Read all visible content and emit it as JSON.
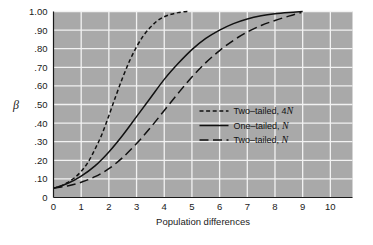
{
  "chart_data": {
    "type": "line",
    "title": "",
    "xlabel": "Population differences",
    "ylabel": "β",
    "xlim": [
      0,
      10.8
    ],
    "ylim": [
      0,
      1.0
    ],
    "grid": true,
    "legend_position": "center-right",
    "x_ticks": [
      "0",
      "1",
      "2",
      "3",
      "4",
      "5",
      "6",
      "7",
      "8",
      "9",
      "10"
    ],
    "x_tick_values": [
      0,
      1,
      2,
      3,
      4,
      5,
      6,
      7,
      8,
      9,
      10
    ],
    "y_ticks": [
      "0",
      ".10",
      ".20",
      ".30",
      ".40",
      ".50",
      ".60",
      ".70",
      ".80",
      ".90",
      "1.00"
    ],
    "y_tick_values": [
      0,
      0.1,
      0.2,
      0.3,
      0.4,
      0.5,
      0.6,
      0.7,
      0.8,
      0.9,
      1.0
    ],
    "series": [
      {
        "name": "Two-tailed, 4N",
        "legend_label_plain": "Two–tailed, 4",
        "legend_label_italic": "N",
        "style": "short-dash",
        "dasharray": "4,2.6",
        "color": "#111111",
        "x": [
          0,
          0.25,
          0.5,
          0.75,
          1.0,
          1.25,
          1.5,
          1.75,
          2.0,
          2.25,
          2.5,
          2.75,
          3.0,
          3.25,
          3.5,
          3.75,
          4.0,
          4.25,
          4.5,
          4.75,
          4.85
        ],
        "y": [
          0.05,
          0.06,
          0.08,
          0.105,
          0.14,
          0.19,
          0.26,
          0.34,
          0.44,
          0.545,
          0.645,
          0.735,
          0.81,
          0.87,
          0.915,
          0.95,
          0.972,
          0.985,
          0.994,
          0.999,
          1.0
        ]
      },
      {
        "name": "One-tailed, N",
        "legend_label_plain": "One–tailed, ",
        "legend_label_italic": "N",
        "style": "solid",
        "dasharray": "none",
        "color": "#111111",
        "x": [
          0,
          0.5,
          1.0,
          1.5,
          2.0,
          2.5,
          3.0,
          3.5,
          4.0,
          4.5,
          5.0,
          5.5,
          6.0,
          6.5,
          7.0,
          7.5,
          8.0,
          8.5,
          9.0
        ],
        "y": [
          0.05,
          0.075,
          0.115,
          0.17,
          0.245,
          0.335,
          0.435,
          0.535,
          0.635,
          0.72,
          0.795,
          0.855,
          0.9,
          0.935,
          0.96,
          0.977,
          0.988,
          0.995,
          1.0
        ]
      },
      {
        "name": "Two-tailed, N",
        "legend_label_plain": "Two–tailed, ",
        "legend_label_italic": "N",
        "style": "long-dash",
        "dasharray": "9,4.5",
        "color": "#111111",
        "x": [
          0,
          0.5,
          1.0,
          1.5,
          2.0,
          2.5,
          3.0,
          3.5,
          4.0,
          4.5,
          5.0,
          5.5,
          6.0,
          6.5,
          7.0,
          7.5,
          8.0,
          8.5,
          8.95
        ],
        "y": [
          0.05,
          0.062,
          0.082,
          0.112,
          0.155,
          0.215,
          0.29,
          0.375,
          0.468,
          0.56,
          0.648,
          0.725,
          0.79,
          0.845,
          0.89,
          0.925,
          0.952,
          0.975,
          0.995
        ]
      }
    ],
    "colors": {
      "plot_background": "#a9a9a9",
      "gridline": "#f2f2f2",
      "axis_line": "#1a1a1a",
      "curve": "#111111",
      "text": "#1a1a1a",
      "page_background": "#ffffff"
    }
  }
}
